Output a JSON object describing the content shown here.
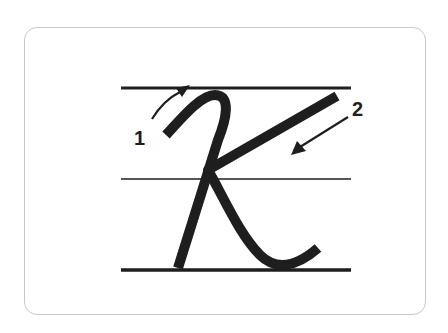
{
  "diagram": {
    "stroke_labels": [
      "1",
      "2"
    ],
    "colors": {
      "ink": "#1e1e1e",
      "card_border": "#c8c8c8",
      "background": "#ffffff"
    },
    "guide_lines": [
      "top",
      "middle",
      "baseline"
    ]
  }
}
